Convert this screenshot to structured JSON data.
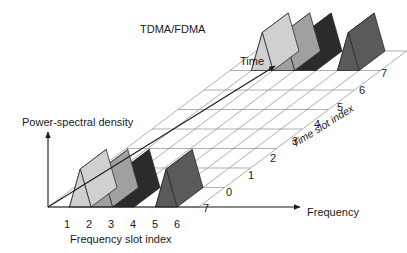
{
  "figure": {
    "title": "TDMA/FDMA",
    "title_pos": {
      "x": 140,
      "y": 24
    },
    "type": "diagram",
    "background": "#ffffff",
    "ink": "#1a1a1a"
  },
  "axes": {
    "vertical": {
      "label": "Power-spectral density",
      "label_pos": {
        "x": 22,
        "y": 117
      },
      "arrow": {
        "x1": 48,
        "y1": 207,
        "x2": 48,
        "y2": 132
      }
    },
    "horizontal": {
      "label": "Frequency",
      "label_pos": {
        "x": 307,
        "y": 207
      },
      "arrow": {
        "x1": 48,
        "y1": 207,
        "x2": 300,
        "y2": 207
      }
    },
    "depth": {
      "label": "Time",
      "label_pos": {
        "x": 240,
        "y": 56
      },
      "arrow": {
        "x1": 48,
        "y1": 207,
        "x2": 275,
        "y2": 66
      }
    },
    "depth_index": {
      "label": "Time slot index",
      "label_pos": {
        "x": 290,
        "y": 140
      },
      "rotation": -32
    },
    "frequency_index": {
      "label": "Frequency slot index",
      "label_pos": {
        "x": 70,
        "y": 234
      }
    }
  },
  "grid": {
    "origin": {
      "x": 48,
      "y": 207
    },
    "freq_step_x": 21.5,
    "freq_slots": 7,
    "depth_step_x": 26.0,
    "depth_step_y": -19.5,
    "time_slots": 7,
    "line_color": "#8c8c8c",
    "line_width": 0.7
  },
  "ticks": {
    "frequency": [
      {
        "label": "1",
        "x": 64,
        "y": 219
      },
      {
        "label": "2",
        "x": 86,
        "y": 219
      },
      {
        "label": "3",
        "x": 108,
        "y": 219
      },
      {
        "label": "4",
        "x": 130,
        "y": 219
      },
      {
        "label": "5",
        "x": 152,
        "y": 219
      },
      {
        "label": "6",
        "x": 174,
        "y": 219
      }
    ],
    "time_front": [
      {
        "label": "7",
        "x": 203,
        "y": 203
      },
      {
        "label": "0",
        "x": 226,
        "y": 187
      },
      {
        "label": "1",
        "x": 248,
        "y": 170
      },
      {
        "label": "2",
        "x": 270,
        "y": 153
      },
      {
        "label": "3",
        "x": 292,
        "y": 136
      },
      {
        "label": "4",
        "x": 314,
        "y": 119
      },
      {
        "label": "5",
        "x": 337,
        "y": 102
      },
      {
        "label": "6",
        "x": 359,
        "y": 85
      },
      {
        "label": "7",
        "x": 381,
        "y": 68
      }
    ]
  },
  "blocks": {
    "description": "Triangular-prism signal bursts occupying frequency/time slots",
    "colors": {
      "light": "#d0d0d0",
      "light_side": "#bdbdbd",
      "medium": "#a0a0a0",
      "medium_side": "#8a8a8a",
      "black": "#2b2b2b",
      "black_side": "#1a1a1a",
      "dark": "#5a5a5a",
      "dark_side": "#4a4a4a"
    },
    "front_row": [
      {
        "slot": 2,
        "shade": "light"
      },
      {
        "slot": 3,
        "shade": "medium"
      },
      {
        "slot": 4,
        "shade": "black"
      },
      {
        "slot": 6,
        "shade": "dark"
      }
    ],
    "back_row": [
      {
        "slot": 2,
        "shade": "light"
      },
      {
        "slot": 3,
        "shade": "medium"
      },
      {
        "slot": 4,
        "shade": "black"
      },
      {
        "slot": 6,
        "shade": "dark"
      }
    ]
  },
  "chart_data": {
    "type": "diagram",
    "title": "TDMA/FDMA",
    "xlabel": "Frequency",
    "ylabel": "Power-spectral density",
    "zlabel": "Time",
    "x_index_label": "Frequency slot index",
    "z_index_label": "Time slot index",
    "frequency_slots": [
      "1",
      "2",
      "3",
      "4",
      "5",
      "6",
      "7"
    ],
    "time_slots": [
      "0",
      "1",
      "2",
      "3",
      "4",
      "5",
      "6",
      "7"
    ],
    "occupancy": [
      {
        "time_slot": 0,
        "frequency_slot": 2,
        "level": "light"
      },
      {
        "time_slot": 0,
        "frequency_slot": 3,
        "level": "medium"
      },
      {
        "time_slot": 0,
        "frequency_slot": 4,
        "level": "black"
      },
      {
        "time_slot": 0,
        "frequency_slot": 6,
        "level": "dark"
      },
      {
        "time_slot": 7,
        "frequency_slot": 2,
        "level": "light"
      },
      {
        "time_slot": 7,
        "frequency_slot": 3,
        "level": "medium"
      },
      {
        "time_slot": 7,
        "frequency_slot": 4,
        "level": "black"
      },
      {
        "time_slot": 7,
        "frequency_slot": 6,
        "level": "dark"
      }
    ]
  }
}
